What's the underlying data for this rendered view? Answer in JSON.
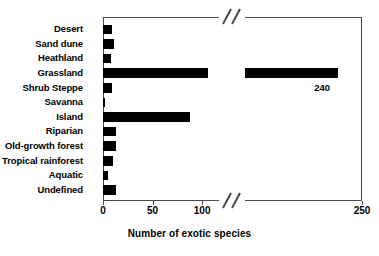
{
  "chart_data": {
    "type": "bar",
    "orientation": "horizontal",
    "title": "",
    "xlabel": "Number of exotic species",
    "ylabel": "",
    "xlim": [
      0,
      250
    ],
    "xticks": [
      0,
      50,
      100,
      250
    ],
    "xtick_labels": [
      "0",
      "50",
      "100",
      "250"
    ],
    "grid": false,
    "legend": null,
    "axis_break": {
      "present": true,
      "between": [
        115,
        200
      ],
      "style": "double-slash"
    },
    "categories": [
      "Desert",
      "Sand dune",
      "Heathland",
      "Grassland",
      "Shrub Steppe",
      "Savanna",
      "Island",
      "Riparian",
      "Old-growth forest",
      "Tropical rainforest",
      "Aquatic",
      "Undefined"
    ],
    "values": [
      9,
      11,
      8,
      240,
      9,
      2,
      88,
      13,
      13,
      10,
      5,
      13
    ],
    "annotations": [
      {
        "text": "240",
        "category": "Grassland",
        "value": 240
      }
    ],
    "bar_color": "#000000",
    "axis_color": "#4a4a4a"
  },
  "axis": {
    "x_title": "Number of exotic species"
  }
}
